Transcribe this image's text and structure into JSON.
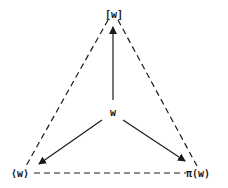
{
  "diagram": {
    "nodes": {
      "top": {
        "label": "[w]",
        "x": 113,
        "y": 14
      },
      "center": {
        "label": "w",
        "x": 113,
        "y": 114
      },
      "left": {
        "label": "⟨w⟩",
        "x": 22,
        "y": 173
      },
      "right": {
        "label": "π(w)",
        "x": 201,
        "y": 173
      }
    },
    "solid_arrows": [
      {
        "from": "center",
        "to": "top"
      },
      {
        "from": "center",
        "to": "left"
      },
      {
        "from": "center",
        "to": "right"
      }
    ],
    "dashed_edges": [
      {
        "from": "top",
        "to": "left"
      },
      {
        "from": "top",
        "to": "right"
      },
      {
        "from": "left",
        "to": "right"
      }
    ],
    "colors": {
      "ink": "#1a1a1a",
      "background": "#ffffff"
    }
  }
}
